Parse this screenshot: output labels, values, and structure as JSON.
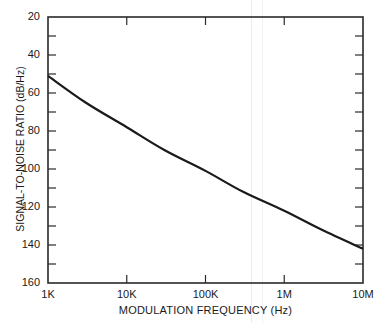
{
  "chart_data": {
    "type": "line",
    "title": "",
    "xlabel": "MODULATION FREQUENCY (Hz)",
    "ylabel": "SIGNAL-TO-NOISE RATIO (dB/Hz)",
    "x_scale": "log",
    "x_ticks": [
      "1K",
      "10K",
      "100K",
      "1M",
      "10M"
    ],
    "x_tick_values": [
      1000,
      10000,
      100000,
      1000000,
      10000000
    ],
    "y_ticks": [
      "20",
      "40",
      "60",
      "80",
      "100",
      "120",
      "140",
      "160"
    ],
    "y_tick_values": [
      20,
      40,
      60,
      80,
      100,
      120,
      140,
      160
    ],
    "y_inverted": true,
    "xlim": [
      1000,
      10000000
    ],
    "ylim": [
      20,
      160
    ],
    "grid": false,
    "legend": null,
    "series": [
      {
        "name": "SNR",
        "x": [
          1000,
          3000,
          10000,
          30000,
          100000,
          300000,
          1000000,
          3000000,
          10000000
        ],
        "values": [
          51,
          65,
          78,
          90,
          101,
          112,
          122,
          132,
          142
        ]
      }
    ]
  },
  "labels": {
    "xlabel": "MODULATION FREQUENCY (Hz)",
    "ylabel": "SIGNAL-TO-NOISE RATIO (dB/Hz)",
    "x_ticks": [
      "1K",
      "10K",
      "100K",
      "1M",
      "10M"
    ],
    "y_ticks": [
      "20",
      "40",
      "60",
      "80",
      "100",
      "120",
      "140",
      "160"
    ]
  },
  "colors": {
    "line": "#1a1a1a",
    "axis": "#2a2a2a",
    "background": "#ffffff"
  }
}
